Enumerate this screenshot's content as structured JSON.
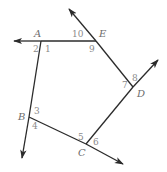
{
  "diagram": {
    "type": "pentagon-exterior-angles",
    "stroke_color": "#2b2b2b",
    "label_color": "#6d6d6d",
    "vertices": [
      {
        "name": "A",
        "x": 41,
        "y": 41,
        "label_x": 34,
        "label_y": 37
      },
      {
        "name": "E",
        "x": 96,
        "y": 41,
        "label_x": 99,
        "label_y": 37
      },
      {
        "name": "D",
        "x": 133,
        "y": 87,
        "label_x": 137,
        "label_y": 97
      },
      {
        "name": "C",
        "x": 86,
        "y": 144,
        "label_x": 78,
        "label_y": 156
      },
      {
        "name": "B",
        "x": 29,
        "y": 117,
        "label_x": 18,
        "label_y": 120
      }
    ],
    "angle_labels": [
      {
        "num": "1",
        "x": 45,
        "y": 52
      },
      {
        "num": "2",
        "x": 33,
        "y": 52
      },
      {
        "num": "3",
        "x": 34,
        "y": 114
      },
      {
        "num": "4",
        "x": 32,
        "y": 129
      },
      {
        "num": "5",
        "x": 78,
        "y": 140
      },
      {
        "num": "6",
        "x": 93,
        "y": 145
      },
      {
        "num": "7",
        "x": 122,
        "y": 88
      },
      {
        "num": "8",
        "x": 132,
        "y": 81
      },
      {
        "num": "9",
        "x": 89,
        "y": 52
      },
      {
        "num": "10",
        "x": 72,
        "y": 37
      }
    ],
    "rays": [
      {
        "from": "A",
        "x1": 41,
        "y1": 41,
        "x2": 14,
        "y2": 41
      },
      {
        "from": "E",
        "x1": 96,
        "y1": 41,
        "x2": 69,
        "y2": 9
      },
      {
        "from": "D",
        "x1": 133,
        "y1": 87,
        "x2": 158,
        "y2": 60
      },
      {
        "from": "C",
        "x1": 86,
        "y1": 144,
        "x2": 123,
        "y2": 164
      },
      {
        "from": "B",
        "x1": 29,
        "y1": 117,
        "x2": 22,
        "y2": 158
      }
    ],
    "segments": [
      {
        "name": "AE",
        "x1": 41,
        "y1": 41,
        "x2": 96,
        "y2": 41
      },
      {
        "name": "ED",
        "x1": 96,
        "y1": 41,
        "x2": 133,
        "y2": 87
      },
      {
        "name": "DC",
        "x1": 133,
        "y1": 87,
        "x2": 86,
        "y2": 144
      },
      {
        "name": "CB",
        "x1": 86,
        "y1": 144,
        "x2": 29,
        "y2": 117
      },
      {
        "name": "BA",
        "x1": 29,
        "y1": 117,
        "x2": 41,
        "y2": 41
      }
    ]
  }
}
